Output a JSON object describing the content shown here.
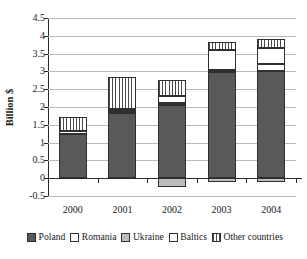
{
  "chart_data": {
    "type": "bar",
    "stacked": true,
    "title": "",
    "xlabel": "",
    "ylabel": "Billion $",
    "categories": [
      "2000",
      "2001",
      "2002",
      "2003",
      "2004"
    ],
    "ylim": [
      -0.5,
      4.5
    ],
    "ytick_labels": [
      "4.5",
      "4",
      "3.5",
      "3",
      "2.5",
      "2",
      "1.5",
      "1",
      "0.5",
      "0",
      "-0.5"
    ],
    "ytick_values": [
      4.5,
      4,
      3.5,
      3,
      2.5,
      2,
      1.5,
      1,
      0.5,
      0,
      -0.5
    ],
    "grid": true,
    "legend_position": "bottom",
    "series": [
      {
        "name": "Poland",
        "color": "#595959",
        "pattern": "solid-dark",
        "values": [
          1.25,
          1.82,
          2.07,
          2.98,
          3.0
        ]
      },
      {
        "name": "Romania",
        "color": "#ffffff",
        "pattern": "solid-white",
        "values": [
          0.08,
          0.06,
          0.05,
          0.05,
          0.22
        ]
      },
      {
        "name": "Ukraine",
        "color": "#bdbdbd",
        "pattern": "solid-light",
        "values": [
          0.0,
          0.07,
          -0.25,
          -0.1,
          -0.1
        ]
      },
      {
        "name": "Baltics",
        "color": "#ffffff",
        "pattern": "dotted",
        "values": [
          0.0,
          0.0,
          0.2,
          0.57,
          0.43
        ]
      },
      {
        "name": "Other countries",
        "color": "#ffffff",
        "pattern": "vertical-hatch",
        "values": [
          0.39,
          0.88,
          0.43,
          0.22,
          0.25
        ]
      }
    ],
    "totals_positive": [
      1.72,
      2.83,
      3.05,
      3.82,
      3.9
    ],
    "totals_negative": [
      0.0,
      0.0,
      -0.25,
      -0.1,
      -0.1
    ]
  },
  "legend": {
    "items": [
      {
        "label": "Poland"
      },
      {
        "label": "Romania"
      },
      {
        "label": "Ukraine"
      },
      {
        "label": "Baltics"
      },
      {
        "label": "Other countries"
      }
    ]
  }
}
